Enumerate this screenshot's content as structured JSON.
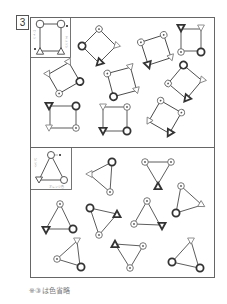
{
  "badge": {
    "number": "3"
  },
  "caption": "※③は色省略",
  "colors": {
    "line": "#333333",
    "frame": "#666666",
    "thin": "#999999"
  },
  "panel_top": {
    "legend": {
      "labels": [
        "ワイン",
        "オレンジ",
        "■",
        "■"
      ],
      "shape": "square"
    },
    "shapes": [
      {
        "id": "sq1",
        "cx": 99,
        "cy": 46,
        "size": 18,
        "rot": 45
      },
      {
        "id": "sq2",
        "cx": 155,
        "cy": 50,
        "size": 18,
        "rot": -15
      },
      {
        "id": "sq3",
        "cx": 194,
        "cy": 40,
        "size": 22,
        "rot": 0
      },
      {
        "id": "sq4",
        "cx": 64,
        "cy": 76,
        "size": 18,
        "rot": -30
      },
      {
        "id": "sq5",
        "cx": 122,
        "cy": 80,
        "size": 20,
        "rot": -15
      },
      {
        "id": "sq6",
        "cx": 188,
        "cy": 78,
        "size": 20,
        "rot": 40
      },
      {
        "id": "sq7",
        "cx": 65,
        "cy": 116,
        "size": 20,
        "rot": 0
      },
      {
        "id": "sq8",
        "cx": 115,
        "cy": 118,
        "size": 22,
        "rot": 0
      },
      {
        "id": "sq9",
        "cx": 165,
        "cy": 117,
        "size": 20,
        "rot": 30
      }
    ]
  },
  "panel_bottom": {
    "legend": {
      "labels": [
        "ピンク",
        "オレンジ色",
        "■"
      ],
      "shape": "triangle"
    },
    "shapes": [
      {
        "id": "tr1",
        "cx": 105,
        "cy": 175
      },
      {
        "id": "tr2",
        "cx": 157,
        "cy": 172
      },
      {
        "id": "tr3",
        "cx": 186,
        "cy": 200
      },
      {
        "id": "tr4",
        "cx": 63,
        "cy": 225
      },
      {
        "id": "tr5",
        "cx": 102,
        "cy": 218
      },
      {
        "id": "tr6",
        "cx": 146,
        "cy": 220
      },
      {
        "id": "tr7",
        "cx": 67,
        "cy": 258
      },
      {
        "id": "tr8",
        "cx": 125,
        "cy": 255
      },
      {
        "id": "tr9",
        "cx": 188,
        "cy": 258
      }
    ]
  }
}
